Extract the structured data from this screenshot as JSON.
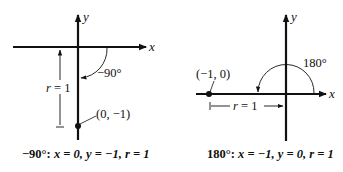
{
  "diagrams": [
    {
      "id": "neg90",
      "axis_x_label": "x",
      "axis_y_label": "y",
      "angle_label": "−90°",
      "point_label": "(0, −1)",
      "radius_label": "r = 1",
      "caption": {
        "angle": "−90°:",
        "x_part": "x = 0,",
        "y_part": "y = −1,",
        "r_part": "r = 1"
      }
    },
    {
      "id": "deg180",
      "axis_x_label": "x",
      "axis_y_label": "y",
      "angle_label": "180°",
      "point_label": "(−1, 0)",
      "radius_label": "r = 1",
      "caption": {
        "angle": "180°:",
        "x_part": "x = −1,",
        "y_part": "y = 0,",
        "r_part": "r = 1"
      }
    }
  ],
  "colors": {
    "ink": "#111111",
    "background": "#ffffff"
  }
}
